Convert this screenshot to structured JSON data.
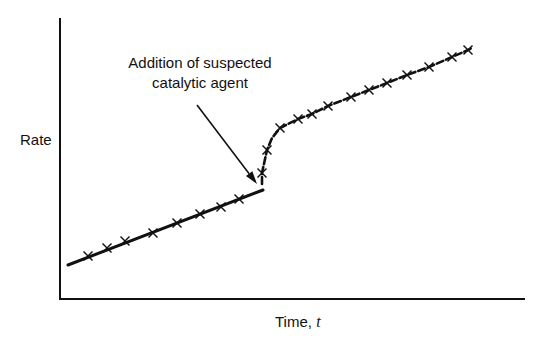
{
  "chart_data": {
    "type": "line",
    "title": "",
    "xlabel": "Time, t",
    "xlabel_text": "Time,",
    "xlabel_var": "t",
    "ylabel": "Rate",
    "grid": false,
    "legend": null,
    "axis_ticks": false,
    "annotation": {
      "line1": "Addition of suspected",
      "line2": "catalytic agent",
      "text": "Addition of suspected catalytic agent",
      "arrow_from": [
        197,
        105
      ],
      "arrow_to": [
        257,
        184
      ]
    },
    "series": [
      {
        "name": "before catalyst (linear fit)",
        "style": "solid",
        "line": [
          [
            68,
            265
          ],
          [
            263,
            190
          ]
        ],
        "markers": [
          [
            88,
            256
          ],
          [
            107,
            248
          ],
          [
            125,
            241
          ],
          [
            153,
            233
          ],
          [
            177,
            223
          ],
          [
            200,
            214
          ],
          [
            221,
            207
          ],
          [
            239,
            199
          ]
        ]
      },
      {
        "name": "after catalyst (dashed curve)",
        "style": "dashed",
        "line": [
          [
            262,
            184
          ],
          [
            262,
            173
          ],
          [
            267,
            150
          ],
          [
            272,
            138
          ],
          [
            280,
            128
          ],
          [
            298,
            119
          ],
          [
            312,
            114
          ],
          [
            328,
            106
          ],
          [
            351,
            97
          ],
          [
            369,
            90
          ],
          [
            387,
            83
          ],
          [
            407,
            75
          ],
          [
            429,
            67
          ],
          [
            452,
            57
          ],
          [
            468,
            50
          ],
          [
            472,
            48
          ]
        ],
        "markers": [
          [
            262,
            173
          ],
          [
            267,
            150
          ],
          [
            280,
            128
          ],
          [
            298,
            119
          ],
          [
            312,
            114
          ],
          [
            328,
            106
          ],
          [
            351,
            97
          ],
          [
            369,
            90
          ],
          [
            387,
            83
          ],
          [
            407,
            75
          ],
          [
            429,
            67
          ],
          [
            452,
            57
          ],
          [
            468,
            50
          ]
        ]
      }
    ],
    "axes": {
      "origin": [
        60,
        299
      ],
      "y_top": 18,
      "x_right": 525
    }
  }
}
